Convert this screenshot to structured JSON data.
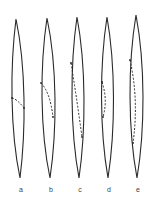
{
  "figure": {
    "stroke_color": "#2a2a2a",
    "background": "#ffffff",
    "spindles": [
      {
        "label": "a",
        "top": [
          16,
          19
        ],
        "bottom": [
          20,
          178
        ],
        "half_width": 6,
        "dash_start": [
          12,
          98
        ],
        "dash_ctrl": [
          17,
          99
        ],
        "dash_end": [
          24,
          108
        ]
      },
      {
        "label": "b",
        "top": [
          47,
          18
        ],
        "bottom": [
          50,
          178
        ],
        "half_width": 6.5,
        "dash_start": [
          41,
          83
        ],
        "dash_ctrl": [
          50,
          92
        ],
        "dash_end": [
          53,
          117
        ]
      },
      {
        "label": "c",
        "top": [
          77,
          17
        ],
        "bottom": [
          79,
          178
        ],
        "half_width": 6,
        "dash_start": [
          71,
          63
        ],
        "dash_ctrl": [
          77,
          100
        ],
        "dash_end": [
          82,
          137
        ]
      },
      {
        "label": "d",
        "top": [
          107,
          17
        ],
        "bottom": [
          108,
          178
        ],
        "half_width": 6,
        "dash_start": [
          102,
          82
        ],
        "dash_ctrl": [
          108,
          100
        ],
        "dash_end": [
          103,
          117
        ]
      },
      {
        "label": "e",
        "top": [
          136,
          15
        ],
        "bottom": [
          137,
          178
        ],
        "half_width": 6.5,
        "dash_start": [
          130,
          60
        ],
        "dash_ctrl": [
          139,
          100
        ],
        "dash_end": [
          133,
          143
        ]
      }
    ]
  }
}
